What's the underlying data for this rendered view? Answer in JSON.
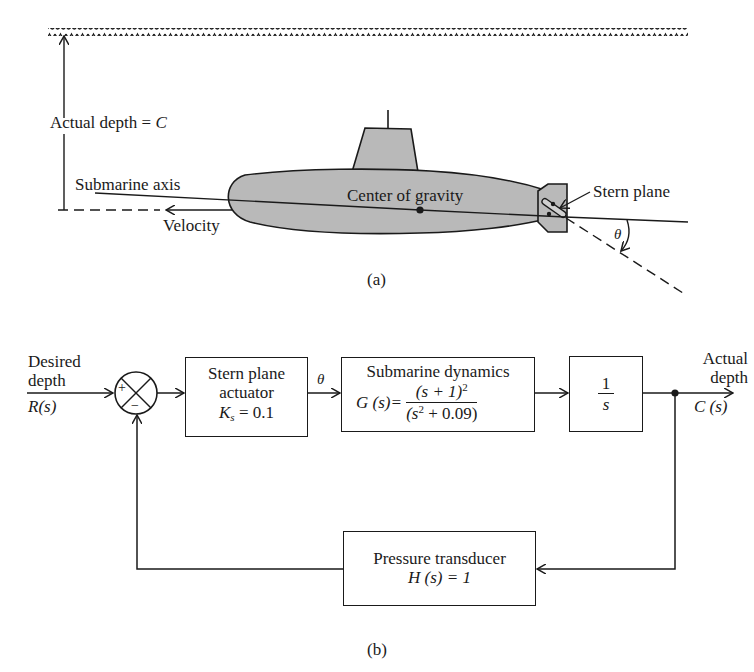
{
  "figure_a": {
    "caption": "(a)",
    "labels": {
      "actual_depth": "Actual depth = ",
      "actual_depth_var": "C",
      "submarine_axis": "Submarine axis",
      "velocity": "Velocity",
      "center_of_gravity": "Center of gravity",
      "stern_plane": "Stern plane",
      "theta": "θ"
    },
    "colors": {
      "hull_fill": "#b9b9b9",
      "line": "#1a1a1a"
    }
  },
  "figure_b": {
    "caption": "(b)",
    "input": {
      "line1": "Desired",
      "line2": "depth",
      "signal": "R(s)"
    },
    "summing_junction": {
      "plus": "+",
      "minus": "−"
    },
    "blocks": {
      "actuator": {
        "line1": "Stern plane",
        "line2": "actuator",
        "gain_var": "K",
        "gain_sub": "s",
        "gain_value": " = 0.1"
      },
      "dynamics": {
        "title": "Submarine dynamics",
        "lhs": "G (s)=",
        "numerator": "(s + 1)",
        "numerator_exp": "2",
        "denominator_a": "(s",
        "denominator_exp": "2",
        "denominator_b": " + 0.09)"
      },
      "integrator": {
        "numerator": "1",
        "denominator": "s"
      },
      "feedback": {
        "line1": "Pressure transducer",
        "line2": "H (s) = 1"
      }
    },
    "signal_theta": "θ",
    "output": {
      "line1": "Actual",
      "line2": "depth",
      "signal": "C (s)"
    }
  }
}
